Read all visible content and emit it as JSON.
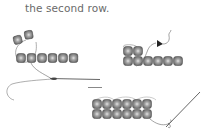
{
  "caption": {
    "line_partial": "",
    "line": "the second row."
  },
  "colors": {
    "bead_outer": "#6b6b6b",
    "bead_mid": "#9a9a9a",
    "bead_inner": "#dcdcdc",
    "thread": "#555555",
    "text": "#6a6a6a"
  },
  "steps": [
    {
      "id": "step-a",
      "description": "two beads on thread looped above first row of six beads, thread exiting to needle"
    },
    {
      "id": "step-b",
      "description": "second row of two beads stacked on first row of six, thread with arrow"
    },
    {
      "id": "step-c",
      "description": "two full rows of six beads with needle exiting right"
    }
  ]
}
